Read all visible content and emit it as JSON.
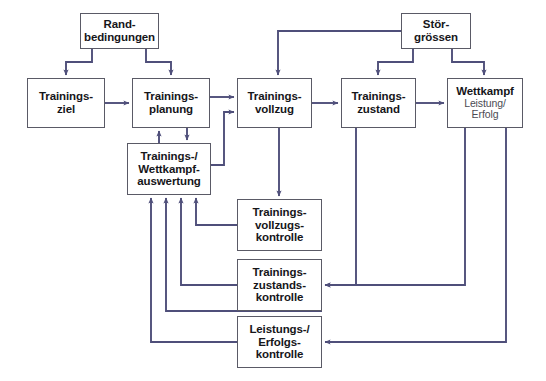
{
  "diagram": {
    "type": "flowchart",
    "colors": {
      "line": "#4f4f7a",
      "box_border": "#5a5a66",
      "text_bold": "#16161a",
      "text_sub": "#4b4b53",
      "background": "#ffffff"
    },
    "nodes": [
      {
        "id": "randbedingungen",
        "lines": [
          {
            "text": "Rand-",
            "style": "bold"
          },
          {
            "text": "bedingungen",
            "style": "bold"
          }
        ],
        "x": 80,
        "y": 13,
        "w": 79,
        "h": 36
      },
      {
        "id": "stoergroessen",
        "lines": [
          {
            "text": "Stör-",
            "style": "bold"
          },
          {
            "text": "grössen",
            "style": "bold"
          }
        ],
        "x": 401,
        "y": 13,
        "w": 70,
        "h": 36
      },
      {
        "id": "trainingsziel",
        "lines": [
          {
            "text": "Trainings-",
            "style": "bold"
          },
          {
            "text": "ziel",
            "style": "bold"
          }
        ],
        "x": 27,
        "y": 78,
        "w": 78,
        "h": 50
      },
      {
        "id": "trainingsplanung",
        "lines": [
          {
            "text": "Trainings-",
            "style": "bold"
          },
          {
            "text": "planung",
            "style": "bold"
          }
        ],
        "x": 132,
        "y": 78,
        "w": 78,
        "h": 50
      },
      {
        "id": "trainingsvollzug",
        "lines": [
          {
            "text": "Trainings-",
            "style": "bold"
          },
          {
            "text": "vollzug",
            "style": "bold"
          }
        ],
        "x": 237,
        "y": 78,
        "w": 75,
        "h": 50
      },
      {
        "id": "trainingszustand",
        "lines": [
          {
            "text": "Trainings-",
            "style": "bold"
          },
          {
            "text": "zustand",
            "style": "bold"
          }
        ],
        "x": 341,
        "y": 78,
        "w": 75,
        "h": 50
      },
      {
        "id": "wettkampf",
        "lines": [
          {
            "text": "Wettkampf",
            "style": "bold"
          },
          {
            "text": "Leistung/",
            "style": "sub"
          },
          {
            "text": "Erfolg",
            "style": "sub"
          }
        ],
        "x": 447,
        "y": 78,
        "w": 76,
        "h": 50
      },
      {
        "id": "auswertung",
        "lines": [
          {
            "text": "Trainings-/",
            "style": "bold"
          },
          {
            "text": "Wettkampf-",
            "style": "bold"
          },
          {
            "text": "auswertung",
            "style": "bold"
          }
        ],
        "x": 127,
        "y": 143,
        "w": 84,
        "h": 52
      },
      {
        "id": "vollzugskontrolle",
        "lines": [
          {
            "text": "Trainings-",
            "style": "bold"
          },
          {
            "text": "vollzugs-",
            "style": "bold"
          },
          {
            "text": "kontrolle",
            "style": "bold"
          }
        ],
        "x": 237,
        "y": 199,
        "w": 85,
        "h": 52
      },
      {
        "id": "zustandskontrolle",
        "lines": [
          {
            "text": "Trainings-",
            "style": "bold"
          },
          {
            "text": "zustands-",
            "style": "bold"
          },
          {
            "text": "kontrolle",
            "style": "bold"
          }
        ],
        "x": 237,
        "y": 259,
        "w": 85,
        "h": 52
      },
      {
        "id": "erfolgskontrolle",
        "lines": [
          {
            "text": "Leistungs-/",
            "style": "bold"
          },
          {
            "text": "Erfolgs-",
            "style": "bold"
          },
          {
            "text": "kontrolle",
            "style": "bold"
          }
        ],
        "x": 237,
        "y": 316,
        "w": 85,
        "h": 52
      }
    ],
    "edges": [
      {
        "from": "randbedingungen",
        "to": "trainingsziel",
        "kind": "arrow"
      },
      {
        "from": "randbedingungen",
        "to": "trainingsplanung",
        "kind": "arrow"
      },
      {
        "from": "trainingsziel",
        "to": "trainingsplanung",
        "kind": "arrow"
      },
      {
        "from": "trainingsplanung",
        "to": "trainingsvollzug",
        "kind": "arrow"
      },
      {
        "from": "trainingsplanung",
        "to": "auswertung",
        "kind": "arrow"
      },
      {
        "from": "auswertung",
        "to": "trainingsplanung",
        "kind": "arrow"
      },
      {
        "from": "auswertung",
        "to": "trainingsvollzug",
        "kind": "arrow"
      },
      {
        "from": "trainingsvollzug",
        "to": "trainingszustand",
        "kind": "arrow"
      },
      {
        "from": "trainingsvollzug",
        "to": "vollzugskontrolle",
        "kind": "arrow"
      },
      {
        "from": "trainingszustand",
        "to": "wettkampf",
        "kind": "arrow"
      },
      {
        "from": "trainingszustand",
        "to": "zustandskontrolle",
        "kind": "arrow"
      },
      {
        "from": "stoergroessen",
        "to": "trainingsvollzug",
        "kind": "arrow"
      },
      {
        "from": "stoergroessen",
        "to": "trainingszustand",
        "kind": "arrow"
      },
      {
        "from": "stoergroessen",
        "to": "wettkampf",
        "kind": "arrow"
      },
      {
        "from": "wettkampf",
        "to": "zustandskontrolle",
        "kind": "arrow"
      },
      {
        "from": "wettkampf",
        "to": "erfolgskontrolle",
        "kind": "arrow"
      },
      {
        "from": "vollzugskontrolle",
        "to": "auswertung",
        "kind": "arrow"
      },
      {
        "from": "zustandskontrolle",
        "to": "auswertung",
        "kind": "arrow"
      },
      {
        "from": "erfolgskontrolle",
        "to": "auswertung",
        "kind": "arrow"
      }
    ]
  }
}
